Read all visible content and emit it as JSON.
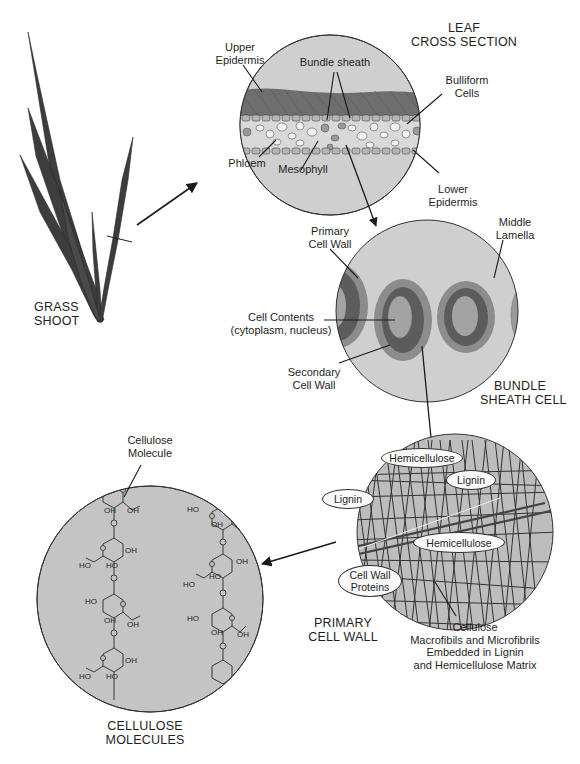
{
  "diagram": {
    "colors": {
      "background": "#ffffff",
      "lens_fill": "#c9c9c9",
      "outline": "#333333",
      "leaf_blade": "#3a3a3a",
      "epidermis_dark": "#6b6b6b",
      "secondary_wall": "#5a5a5a",
      "primary_wall": "#8a8a8a",
      "cell_contents": "#a3a3a3",
      "label_oval_fill": "#fafafa",
      "text": "#1e1e1e"
    },
    "panels": {
      "grass_shoot": {
        "title_line1": "GRASS",
        "title_line2": "SHOOT"
      },
      "leaf_cross_section": {
        "title_line1": "LEAF",
        "title_line2": "CROSS SECTION",
        "labels": {
          "upper_epidermis_1": "Upper",
          "upper_epidermis_2": "Epidermis",
          "bundle_sheath": "Bundle sheath",
          "bulliform_1": "Bulliform",
          "bulliform_2": "Cells",
          "phloem": "Phloem",
          "mesophyll": "Mesophyll",
          "lower_epidermis_1": "Lower",
          "lower_epidermis_2": "Epidermis"
        }
      },
      "bundle_sheath_cell": {
        "title_line1": "BUNDLE",
        "title_line2": "SHEATH CELL",
        "labels": {
          "primary_wall_1": "Primary",
          "primary_wall_2": "Cell Wall",
          "middle_lamella_1": "Middle",
          "middle_lamella_2": "Lamella",
          "cell_contents_1": "Cell Contents",
          "cell_contents_2": "(cytoplasm, nucleus)",
          "secondary_wall_1": "Secondary",
          "secondary_wall_2": "Cell Wall"
        }
      },
      "primary_cell_wall": {
        "title_line1": "PRIMARY",
        "title_line2": "CELL WALL",
        "ovals": {
          "hemicellulose_top": "Hemicellulose",
          "lignin_right": "Lignin",
          "lignin_left": "Lignin",
          "hemicellulose_mid": "Hemicellulose",
          "cell_wall_proteins_1": "Cell Wall",
          "cell_wall_proteins_2": "Proteins"
        },
        "caption": {
          "line1": "Cellulose",
          "line2": "Macrofibils and Microfibrils",
          "line3": "Embedded in Lignin",
          "line4": "and Hemicellulose Matrix"
        }
      },
      "cellulose_molecules": {
        "title_line1": "CELLULOSE",
        "title_line2": "MOLECULES",
        "labels": {
          "molecule_1": "Cellulose",
          "molecule_2": "Molecule"
        },
        "group_labels": {
          "oh": "OH",
          "ho": "HO"
        }
      }
    }
  }
}
